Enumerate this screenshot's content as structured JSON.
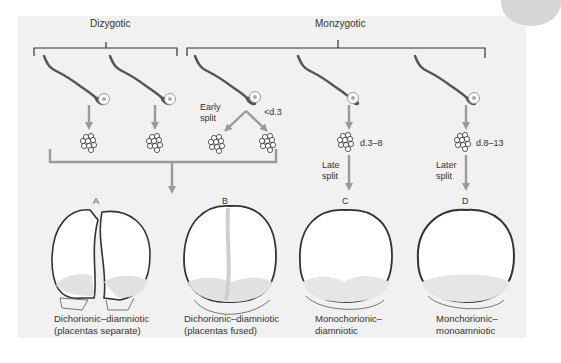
{
  "diagram": {
    "groups": {
      "dizygotic": "Dizygotic",
      "monozygotic": "Monzygotic"
    },
    "split_labels": {
      "early": [
        "Early",
        "split"
      ],
      "early_timing": "<d.3",
      "late": [
        "Late",
        "split"
      ],
      "late_timing": "d.3–8",
      "later": [
        "Later",
        "split"
      ],
      "later_timing": "d.8–13"
    },
    "outcomes": [
      {
        "letter": "A",
        "caption": [
          "Dichorionic–diamniotic",
          "(placentas separate)"
        ]
      },
      {
        "letter": "B",
        "caption": [
          "Dichorionic–diamniotic",
          "(placentas fused)"
        ]
      },
      {
        "letter": "C",
        "caption": [
          "Monochorionic–",
          "diamniotic"
        ]
      },
      {
        "letter": "D",
        "caption": [
          "Monchorionic–",
          "monoamniotic"
        ]
      }
    ],
    "colors": {
      "background": "#f1f1f1",
      "arrow": "#9a9a9a",
      "outline": "#3a3a3a",
      "membrane": "#c8c8c8"
    }
  }
}
